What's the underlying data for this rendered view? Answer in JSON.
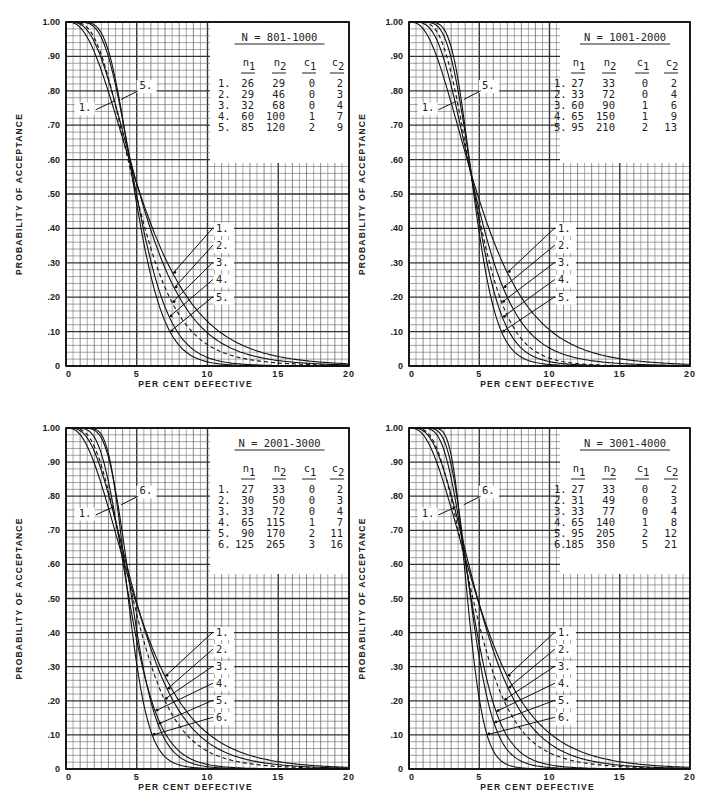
{
  "axes": {
    "ylabel": "PROBABILITY OF ACCEPTANCE",
    "xlabel": "PER CENT DEFECTIVE",
    "yticks": [
      "0",
      ".10",
      ".20",
      ".30",
      ".40",
      ".50",
      ".60",
      ".70",
      ".80",
      ".90",
      "1.00"
    ],
    "xticks": [
      "0",
      "5",
      "10",
      "15",
      "20"
    ]
  },
  "chart_data": [
    {
      "type": "line",
      "title": "N = 801-1000",
      "xlabel": "PER CENT DEFECTIVE",
      "ylabel": "PROBABILITY OF ACCEPTANCE",
      "xlim": [
        0,
        20
      ],
      "ylim": [
        0,
        1.0
      ],
      "grid": true,
      "table_headers": [
        "n1",
        "n2",
        "c1",
        "c2"
      ],
      "series": [
        {
          "name": "1.",
          "n1": 26,
          "n2": 29,
          "c1": 0,
          "c2": 2,
          "dashed": false
        },
        {
          "name": "2.",
          "n1": 29,
          "n2": 46,
          "c1": 0,
          "c2": 3,
          "dashed": false
        },
        {
          "name": "3.",
          "n1": 32,
          "n2": 68,
          "c1": 0,
          "c2": 4,
          "dashed": true
        },
        {
          "name": "4.",
          "n1": 60,
          "n2": 100,
          "c1": 1,
          "c2": 7,
          "dashed": false
        },
        {
          "name": "5.",
          "n1": 85,
          "n2": 120,
          "c1": 2,
          "c2": 9,
          "dashed": false
        }
      ],
      "top_callouts": [
        "1.",
        "5."
      ],
      "bottom_callouts": [
        "1.",
        "2.",
        "3.",
        "4.",
        "5."
      ]
    },
    {
      "type": "line",
      "title": "N = 1001-2000",
      "xlabel": "PER CENT DEFECTIVE",
      "ylabel": "PROBABILITY OF ACCEPTANCE",
      "xlim": [
        0,
        20
      ],
      "ylim": [
        0,
        1.0
      ],
      "grid": true,
      "table_headers": [
        "n1",
        "n2",
        "c1",
        "c2"
      ],
      "series": [
        {
          "name": "1.",
          "n1": 27,
          "n2": 33,
          "c1": 0,
          "c2": 2,
          "dashed": false
        },
        {
          "name": "2.",
          "n1": 33,
          "n2": 72,
          "c1": 0,
          "c2": 4,
          "dashed": false
        },
        {
          "name": "3.",
          "n1": 60,
          "n2": 90,
          "c1": 1,
          "c2": 6,
          "dashed": true
        },
        {
          "name": "4.",
          "n1": 65,
          "n2": 150,
          "c1": 1,
          "c2": 9,
          "dashed": false
        },
        {
          "name": "5.",
          "n1": 95,
          "n2": 210,
          "c1": 2,
          "c2": 13,
          "dashed": false
        }
      ],
      "top_callouts": [
        "1.",
        "5."
      ],
      "bottom_callouts": [
        "1.",
        "2.",
        "3.",
        "4.",
        "5."
      ]
    },
    {
      "type": "line",
      "title": "N = 2001-3000",
      "xlabel": "PER CENT DEFECTIVE",
      "ylabel": "PROBABILITY OF ACCEPTANCE",
      "xlim": [
        0,
        20
      ],
      "ylim": [
        0,
        1.0
      ],
      "grid": true,
      "table_headers": [
        "n1",
        "n2",
        "c1",
        "c2"
      ],
      "series": [
        {
          "name": "1.",
          "n1": 27,
          "n2": 33,
          "c1": 0,
          "c2": 2,
          "dashed": false
        },
        {
          "name": "2.",
          "n1": 30,
          "n2": 50,
          "c1": 0,
          "c2": 3,
          "dashed": false
        },
        {
          "name": "3.",
          "n1": 33,
          "n2": 72,
          "c1": 0,
          "c2": 4,
          "dashed": true
        },
        {
          "name": "4.",
          "n1": 65,
          "n2": 115,
          "c1": 1,
          "c2": 7,
          "dashed": false
        },
        {
          "name": "5.",
          "n1": 90,
          "n2": 170,
          "c1": 2,
          "c2": 11,
          "dashed": false
        },
        {
          "name": "6.",
          "n1": 125,
          "n2": 265,
          "c1": 3,
          "c2": 16,
          "dashed": false
        }
      ],
      "top_callouts": [
        "1.",
        "6."
      ],
      "bottom_callouts": [
        "1.",
        "2.",
        "3.",
        "4.",
        "5.",
        "6."
      ]
    },
    {
      "type": "line",
      "title": "N = 3001-4000",
      "xlabel": "PER CENT DEFECTIVE",
      "ylabel": "PROBABILITY OF ACCEPTANCE",
      "xlim": [
        0,
        20
      ],
      "ylim": [
        0,
        1.0
      ],
      "grid": true,
      "table_headers": [
        "n1",
        "n2",
        "c1",
        "c2"
      ],
      "series": [
        {
          "name": "1.",
          "n1": 27,
          "n2": 33,
          "c1": 0,
          "c2": 2,
          "dashed": false
        },
        {
          "name": "2.",
          "n1": 31,
          "n2": 49,
          "c1": 0,
          "c2": 3,
          "dashed": false
        },
        {
          "name": "3.",
          "n1": 33,
          "n2": 77,
          "c1": 0,
          "c2": 4,
          "dashed": true
        },
        {
          "name": "4.",
          "n1": 65,
          "n2": 140,
          "c1": 1,
          "c2": 8,
          "dashed": false
        },
        {
          "name": "5.",
          "n1": 95,
          "n2": 205,
          "c1": 2,
          "c2": 12,
          "dashed": false
        },
        {
          "name": "6.",
          "n1": 185,
          "n2": 350,
          "c1": 5,
          "c2": 21,
          "dashed": false
        }
      ],
      "top_callouts": [
        "1.",
        "6."
      ],
      "bottom_callouts": [
        "1.",
        "2.",
        "3.",
        "4.",
        "5.",
        "6."
      ]
    }
  ]
}
